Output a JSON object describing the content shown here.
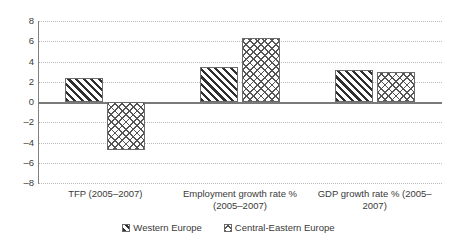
{
  "chart_data": {
    "type": "bar",
    "title": "",
    "subtitle": "",
    "xlabel": "",
    "ylabel": "",
    "ylim": [
      -8,
      8
    ],
    "ytick_step": 2,
    "yticks": [
      "8",
      "6",
      "4",
      "2",
      "0",
      "-2",
      "-4",
      "-6",
      "-8"
    ],
    "grid": true,
    "grid_style": "dotted-horizontal",
    "legend_position": "bottom",
    "categories": [
      "TFP (2005–2007)",
      "Employment growth rate % (2005–2007)",
      "GDP growth rate % (2005–2007)"
    ],
    "series": [
      {
        "name": "Western Europe",
        "pattern": "diagonal-hatch",
        "values": [
          2.4,
          3.5,
          3.2
        ]
      },
      {
        "name": "Central-Eastern Europe",
        "pattern": "cross-hatch",
        "values": [
          -4.7,
          6.3,
          3.0
        ]
      }
    ],
    "colors": {
      "axis": "#7a7a7a",
      "gridline": "#b9b9b9",
      "bar_outline": "#6b6b6b",
      "text": "#3a3a3a",
      "background": "#ffffff"
    }
  }
}
